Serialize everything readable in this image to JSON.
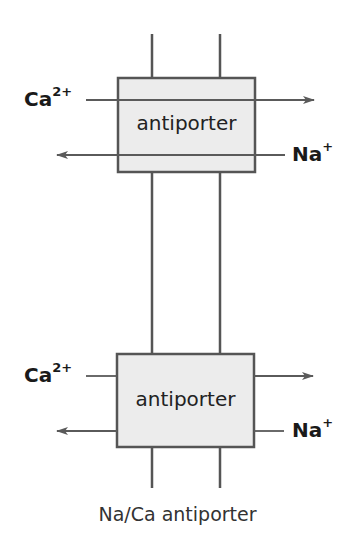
{
  "diagram": {
    "caption": "Na/Ca antiporter",
    "colors": {
      "line": "#5a5a5a",
      "box_fill": "#ececec",
      "box_border": "#555555",
      "text": "#1a1a1a"
    },
    "transporters": [
      {
        "label": "antiporter",
        "in_ion": {
          "symbol": "Ca",
          "charge": "2+"
        },
        "out_ion": {
          "symbol": "Na",
          "charge": "+"
        },
        "arrows": "through-box"
      },
      {
        "label": "antiporter",
        "in_ion": {
          "symbol": "Ca",
          "charge": "2+"
        },
        "out_ion": {
          "symbol": "Na",
          "charge": "+"
        },
        "arrows": "split-at-box"
      }
    ]
  }
}
